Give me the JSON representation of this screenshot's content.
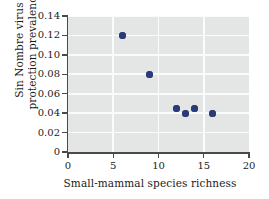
{
  "chart_data": {
    "type": "scatter",
    "title": "",
    "xlabel": "Small-mammal species richness",
    "ylabel_lines": [
      "Sin Nombre virus",
      "protection prevalence"
    ],
    "ylabel": "Sin Nombre virus protection prevalence",
    "xlim": [
      0,
      20
    ],
    "ylim": [
      0,
      0.14
    ],
    "xticks": [
      0,
      5,
      10,
      15,
      20
    ],
    "xtick_labels": [
      "0",
      "5",
      "10",
      "15",
      "20"
    ],
    "yticks": [
      0,
      0.02,
      0.04,
      0.06,
      0.08,
      0.1,
      0.12,
      0.14
    ],
    "ytick_labels": [
      "0",
      "0.02",
      "0.04",
      "0.06",
      "0.08",
      "0.10",
      "0.12",
      "0.14"
    ],
    "grid": true,
    "legend": null,
    "series": [
      {
        "name": "Sin Nombre virus prevalence",
        "marker": "filled-circle",
        "color": "#2b3a78",
        "points": [
          {
            "x": 6,
            "y": 0.12
          },
          {
            "x": 9,
            "y": 0.08
          },
          {
            "x": 12,
            "y": 0.045
          },
          {
            "x": 13,
            "y": 0.04
          },
          {
            "x": 14,
            "y": 0.045
          },
          {
            "x": 16,
            "y": 0.04
          }
        ]
      }
    ],
    "colors": {
      "marker": "#2b3a78",
      "panel_background": "#e4e6e6",
      "gridline": "#fafbfb",
      "axis": "#4a4a4a",
      "text": "#1b1b1b",
      "figure_background": "#ffffff"
    }
  }
}
